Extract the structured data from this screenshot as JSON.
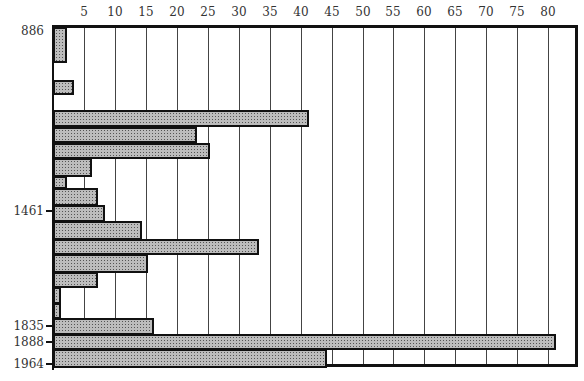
{
  "chart_data": {
    "type": "bar",
    "orientation": "horizontal",
    "title": "",
    "xlabel": "",
    "ylabel": "",
    "x_ticks": [
      5,
      10,
      15,
      20,
      25,
      30,
      35,
      40,
      45,
      50,
      55,
      60,
      65,
      70,
      75,
      80
    ],
    "xlim": [
      0,
      84
    ],
    "grid": true,
    "y_tick_labels": [
      {
        "label": "886",
        "y": 31
      },
      {
        "label": "1461",
        "y": 211
      },
      {
        "label": "1835",
        "y": 326
      },
      {
        "label": "1888",
        "y": 342
      },
      {
        "label": "1964",
        "y": 364
      }
    ],
    "bars": [
      {
        "top": 27,
        "bottom": 63,
        "value": 2
      },
      {
        "top": 80,
        "bottom": 95,
        "value": 3
      },
      {
        "top": 110,
        "bottom": 127,
        "value": 41
      },
      {
        "top": 127,
        "bottom": 143,
        "value": 23
      },
      {
        "top": 143,
        "bottom": 159,
        "value": 25
      },
      {
        "top": 158,
        "bottom": 177,
        "value": 6
      },
      {
        "top": 176,
        "bottom": 189,
        "value": 2
      },
      {
        "top": 188,
        "bottom": 206,
        "value": 7
      },
      {
        "top": 205,
        "bottom": 222,
        "value": 8
      },
      {
        "top": 221,
        "bottom": 240,
        "value": 14
      },
      {
        "top": 239,
        "bottom": 255,
        "value": 33
      },
      {
        "top": 254,
        "bottom": 273,
        "value": 15
      },
      {
        "top": 272,
        "bottom": 288,
        "value": 7
      },
      {
        "top": 287,
        "bottom": 304,
        "value": 1
      },
      {
        "top": 303,
        "bottom": 319,
        "value": 1
      },
      {
        "top": 318,
        "bottom": 335,
        "value": 16
      },
      {
        "top": 334,
        "bottom": 350,
        "value": 81
      },
      {
        "top": 349,
        "bottom": 368,
        "value": 44
      }
    ],
    "values": [
      2,
      3,
      41,
      23,
      25,
      6,
      2,
      7,
      8,
      14,
      33,
      15,
      7,
      1,
      1,
      16,
      81,
      44
    ],
    "colors": {
      "bar_fill": "#bdbdbd",
      "bar_edge": "#111111",
      "grid": "#444444"
    }
  }
}
